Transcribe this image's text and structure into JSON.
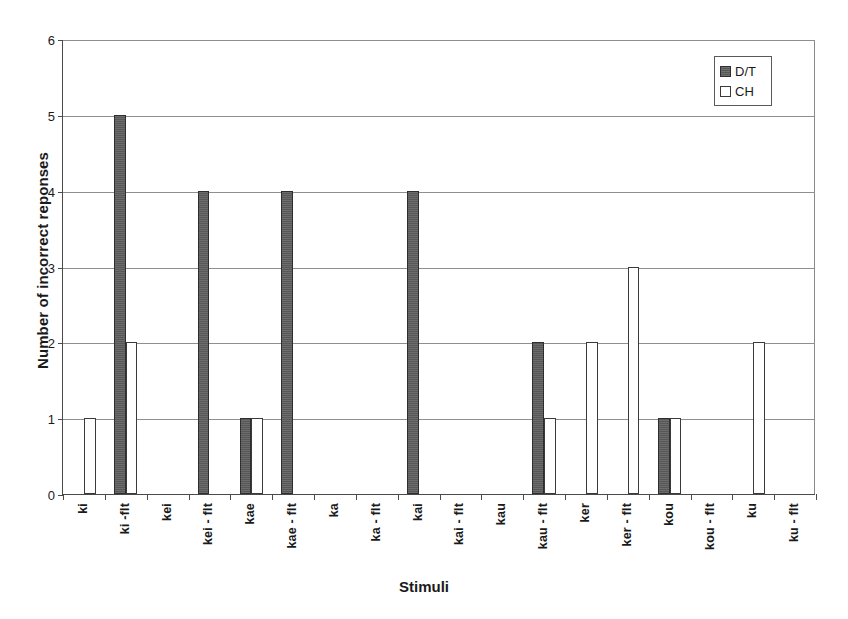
{
  "chart_data": {
    "type": "bar",
    "title": "",
    "xlabel": "Stimuli",
    "ylabel": "Number of incorrect reponses",
    "ylim": [
      0,
      6
    ],
    "yticks": [
      0,
      1,
      2,
      3,
      4,
      5,
      6
    ],
    "ytick_labels": [
      "0",
      "1",
      "2",
      "3",
      "4",
      "5",
      "6"
    ],
    "grid": "horizontal",
    "legend_position": "top-right",
    "categories": [
      "ki",
      "ki -flt",
      "kei",
      "kei - flt",
      "kae",
      "kae - flt",
      "ka",
      "ka - flt",
      "kai",
      "kai - flt",
      "kau",
      "kau - flt",
      "ker",
      "ker - flt",
      "kou",
      "kou - flt",
      "ku",
      "ku - flt"
    ],
    "series": [
      {
        "name": "D/T",
        "color": "#575757",
        "values": [
          0,
          5,
          0,
          4,
          1,
          4,
          0,
          0,
          4,
          0,
          0,
          2,
          0,
          0,
          1,
          0,
          0,
          0
        ]
      },
      {
        "name": "CH",
        "color": "#ffffff",
        "values": [
          1,
          2,
          0,
          0,
          1,
          0,
          0,
          0,
          0,
          0,
          0,
          1,
          2,
          3,
          1,
          0,
          2,
          0
        ]
      }
    ]
  },
  "legend": {
    "entries": [
      {
        "label": "D/T",
        "swatch": "dt"
      },
      {
        "label": "CH",
        "swatch": "ch"
      }
    ]
  },
  "axes": {
    "x_title": "Stimuli",
    "y_title": "Number of incorrect reponses"
  }
}
